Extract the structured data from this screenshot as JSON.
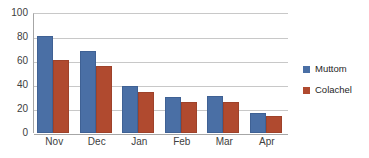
{
  "chart_data": {
    "type": "bar",
    "title": "",
    "subtitle": "",
    "xlabel": "",
    "ylabel": "",
    "categories": [
      "Nov",
      "Dec",
      "Jan",
      "Feb",
      "Mar",
      "Apr"
    ],
    "series": [
      {
        "name": "Muttom",
        "color": "#4a6fa5",
        "values": [
          81,
          68,
          39,
          30,
          31,
          17
        ]
      },
      {
        "name": "Colachel",
        "color": "#b04a2f",
        "values": [
          61,
          56,
          34,
          26,
          26,
          14
        ]
      }
    ],
    "ylim": [
      0,
      100
    ],
    "yticks": [
      0,
      20,
      40,
      60,
      80,
      100
    ],
    "ytick_labels": [
      "0",
      "20",
      "40",
      "60",
      "80",
      "100"
    ],
    "grid": true,
    "grid_axis": "y",
    "legend_position": "right",
    "colors": {
      "series_muttom": "#4a6fa5",
      "series_colachel": "#b04a2f",
      "gridline": "#c8c8c8",
      "axis": "#a6a6a6",
      "tick_text": "#404040",
      "legend_text": "#262626",
      "background": "#ffffff"
    }
  },
  "legend": {
    "items": [
      {
        "label": "Muttom",
        "swatch": "legend-swatch-muttom"
      },
      {
        "label": "Colachel",
        "swatch": "legend-swatch-colachel"
      }
    ]
  }
}
